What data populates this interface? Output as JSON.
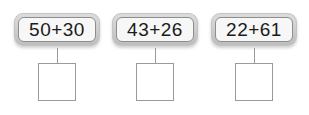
{
  "worksheet": {
    "type": "math-addition-worksheet",
    "background_color": "#ffffff",
    "problem_count": 3,
    "problems": [
      {
        "expression": "50+30",
        "first_addend": "50",
        "operator": "+",
        "second_addend": "30",
        "answer": ""
      },
      {
        "expression": "43+26",
        "first_addend": "43",
        "operator": "+",
        "second_addend": "26",
        "answer": ""
      },
      {
        "expression": "22+61",
        "first_addend": "22",
        "operator": "+",
        "second_addend": "61",
        "answer": ""
      }
    ],
    "colors": {
      "card_frame": "#cfcfcf",
      "card_inner": "#f7f7f7",
      "card_inner_border": "#8d8d8d",
      "text": "#1b1b1b",
      "box_border": "#9a9a9a",
      "connector": "#9a9a9a"
    }
  }
}
